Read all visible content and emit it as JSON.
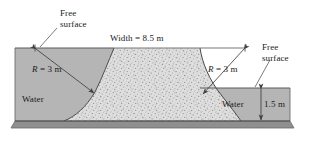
{
  "figure": {
    "type": "engineering-cross-section-diagram"
  },
  "labels": {
    "free_surface_left_line1": "Free",
    "free_surface_left_line2": "surface",
    "free_surface_right_line1": "Free",
    "free_surface_right_line2": "surface",
    "width": "Width = 8.5 m",
    "radius_left_sym": "R",
    "radius_left_val": " = 3 m",
    "radius_right_sym": "R",
    "radius_right_val": " = 3 m",
    "water_left": "Water",
    "water_right": "Water",
    "depth_right": "1.5 m"
  },
  "values": {
    "width_m": 8.5,
    "radius_left_m": 3,
    "radius_right_m": 3,
    "right_depth_m": 1.5
  },
  "colors": {
    "water_fill": "#b5b5b5",
    "stipple_fill": "#dcdcdc",
    "ground_fill": "#8c8c8c",
    "outline": "#4d4d4d",
    "text": "#1a1a1a",
    "background": "#ffffff"
  }
}
